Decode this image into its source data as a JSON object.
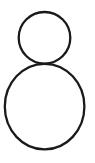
{
  "canvas": {
    "width": 95,
    "height": 163,
    "background_color": "#ffffff",
    "title": "Two stacked circle outlines"
  },
  "drawing": {
    "name": "stacked-circles",
    "description": "Line drawing of two tangent circle outlines stacked vertically, the smaller on top of the larger",
    "stroke_color": "#1a1a1a",
    "fill_color": "none",
    "shape_count": 2,
    "shapes": [
      {
        "name": "small-circle",
        "type": "ellipse",
        "cx": 44.5,
        "cy": 37.8,
        "rx": 25.8,
        "ry": 25.8,
        "stroke_width": 2.3,
        "stroke_color": "#1a1a1a",
        "fill": "none"
      },
      {
        "name": "large-circle",
        "type": "ellipse",
        "cx": 44.6,
        "cy": 106.6,
        "rx": 39.8,
        "ry": 42.8,
        "stroke_width": 2.3,
        "stroke_color": "#1a1a1a",
        "fill": "none"
      }
    ]
  }
}
